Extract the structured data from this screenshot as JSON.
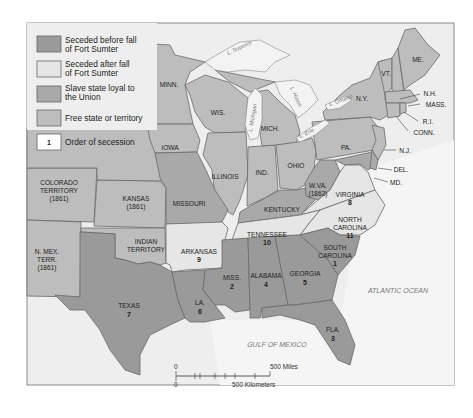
{
  "legend": {
    "items": [
      {
        "key": "seceded_before",
        "line1": "Seceded before fall",
        "line2": "of Fort Sumter",
        "color": "#9a9a9a"
      },
      {
        "key": "seceded_after",
        "line1": "Seceded after fall",
        "line2": "of Fort Sumter",
        "color": "#e6e6e6"
      },
      {
        "key": "slave_loyal",
        "line1": "Slave state loyal to",
        "line2": "the Union",
        "color": "#a9a9a9"
      },
      {
        "key": "free",
        "line1": "Free state or territory",
        "line2": "",
        "color": "#bdbdbd"
      },
      {
        "key": "order",
        "line1": "Order of secession",
        "line2": "",
        "sample": "1",
        "color": "#ffffff"
      }
    ]
  },
  "states": {
    "me": {
      "label": "ME.",
      "category": "free"
    },
    "vt": {
      "label": "VT.",
      "category": "free"
    },
    "nh": {
      "label": "N.H.",
      "category": "free"
    },
    "mass": {
      "label": "MASS.",
      "category": "free"
    },
    "ri": {
      "label": "R.I.",
      "category": "free"
    },
    "conn": {
      "label": "CONN.",
      "category": "free"
    },
    "ny": {
      "label": "N.Y.",
      "category": "free"
    },
    "pa": {
      "label": "PA.",
      "category": "free"
    },
    "nj": {
      "label": "N.J.",
      "category": "free"
    },
    "del": {
      "label": "DEL.",
      "category": "slave_loyal"
    },
    "md": {
      "label": "MD.",
      "category": "slave_loyal"
    },
    "ohio": {
      "label": "OHIO",
      "category": "free"
    },
    "ind": {
      "label": "IND.",
      "category": "free"
    },
    "ill": {
      "label": "ILLINOIS",
      "category": "free"
    },
    "mich": {
      "label": "MICH.",
      "category": "free"
    },
    "wis": {
      "label": "WIS.",
      "category": "free"
    },
    "minn": {
      "label": "MINN.",
      "category": "free"
    },
    "iowa": {
      "label": "IOWA",
      "category": "free"
    },
    "mo": {
      "label": "MISSOURI",
      "category": "slave_loyal"
    },
    "ky": {
      "label": "KENTUCKY",
      "category": "slave_loyal"
    },
    "wva": {
      "label": "W.VA.",
      "sub": "(1863)",
      "category": "slave_loyal"
    },
    "va": {
      "label": "VIRGINIA",
      "order": "8",
      "category": "seceded_after"
    },
    "nc": {
      "label": "NORTH",
      "label2": "CAROLINA",
      "order": "11",
      "category": "seceded_after"
    },
    "tn": {
      "label": "TENNESSEE",
      "order": "10",
      "category": "seceded_after"
    },
    "ark": {
      "label": "ARKANSAS",
      "order": "9",
      "category": "seceded_after"
    },
    "sc": {
      "label": "SOUTH",
      "label2": "CAROLINA",
      "order": "1",
      "category": "seceded_before"
    },
    "ga": {
      "label": "GEORGIA",
      "order": "5",
      "category": "seceded_before"
    },
    "ala": {
      "label": "ALABAMA",
      "order": "4",
      "category": "seceded_before"
    },
    "miss": {
      "label": "MISS.",
      "order": "2",
      "category": "seceded_before"
    },
    "la": {
      "label": "LA.",
      "order": "6",
      "category": "seceded_before"
    },
    "fla": {
      "label": "FLA.",
      "order": "3",
      "category": "seceded_before"
    },
    "tex": {
      "label": "TEXAS",
      "order": "7",
      "category": "seceded_before"
    },
    "kansas": {
      "label": "KANSAS",
      "sub": "(1861)",
      "category": "free"
    },
    "colorado": {
      "label": "COLORADO",
      "label2": "TERRITORY",
      "sub": "(1861)",
      "category": "free"
    },
    "nmex": {
      "label": "N. MEX.",
      "label2": "TERR.",
      "sub": "(1861)",
      "category": "free"
    },
    "indian": {
      "label": "INDIAN",
      "label2": "TERRITORY",
      "category": "free"
    }
  },
  "water": {
    "superior": "L. Superior",
    "michigan": "L. Michigan",
    "huron": "L. Huron",
    "erie": "L. Erie",
    "ontario": "L. Ontario",
    "atlantic": "ATLANTIC OCEAN",
    "gulf": "GULF OF MEXICO"
  },
  "scale": {
    "zero_miles": "0",
    "zero_km": "0",
    "miles": "500 Miles",
    "km": "500 Kilometers"
  }
}
